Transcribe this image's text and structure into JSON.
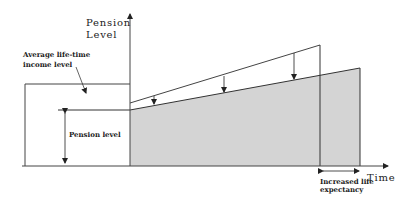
{
  "diagram": {
    "title": "",
    "y_axis_label_line1": "Pension",
    "y_axis_label_line2": "Level",
    "x_axis_label": "Time",
    "income_label_line1": "Average life-time",
    "income_label_line2": "income level",
    "pension_level_label": "Pension level",
    "life_expectancy_label_line1": "Increased life",
    "life_expectancy_label_line2": "expectancy",
    "colors": {
      "line": "#333333",
      "fill": "#d4d4d4",
      "background": "#ffffff"
    }
  }
}
